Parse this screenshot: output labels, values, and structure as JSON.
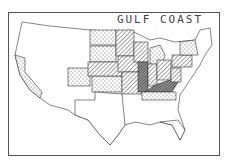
{
  "map": {
    "title": "GULF COAST",
    "legend_patterns": {
      "dotted": "light dots",
      "hatched": "diagonal hatching",
      "dense": "dense cross-hatching"
    },
    "colors": {
      "stroke": "#333333",
      "background": "#ffffff"
    }
  }
}
